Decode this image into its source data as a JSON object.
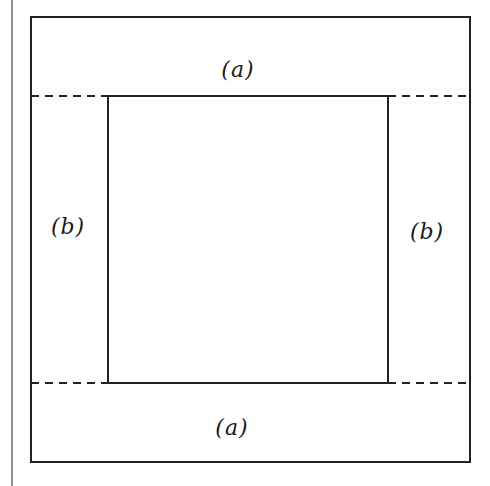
{
  "diagram": {
    "type": "frame-with-strips",
    "stroke_color": "#222222",
    "background": "#ffffff",
    "page_margin_line": {
      "x": 12,
      "y1": 0,
      "y2": 486
    },
    "outer_box": {
      "x": 31,
      "y": 17,
      "width": 439,
      "height": 445
    },
    "inner_box": {
      "x": 108,
      "y": 96,
      "width": 280,
      "height": 287
    },
    "dashed_lines": [
      {
        "name": "top-left-dash",
        "x1": 31,
        "y1": 96,
        "x2": 108,
        "y2": 96
      },
      {
        "name": "top-right-dash",
        "x1": 388,
        "y1": 96,
        "x2": 470,
        "y2": 96
      },
      {
        "name": "bottom-left-dash",
        "x1": 31,
        "y1": 383,
        "x2": 108,
        "y2": 383
      },
      {
        "name": "bottom-right-dash",
        "x1": 388,
        "y1": 383,
        "x2": 470,
        "y2": 383
      }
    ],
    "labels": {
      "top": {
        "text": "(a)",
        "x": 238,
        "y": 70
      },
      "left": {
        "text": "(b)",
        "x": 68,
        "y": 227
      },
      "right": {
        "text": "(b)",
        "x": 427,
        "y": 232
      },
      "bottom": {
        "text": "(a)",
        "x": 232,
        "y": 428
      }
    }
  }
}
